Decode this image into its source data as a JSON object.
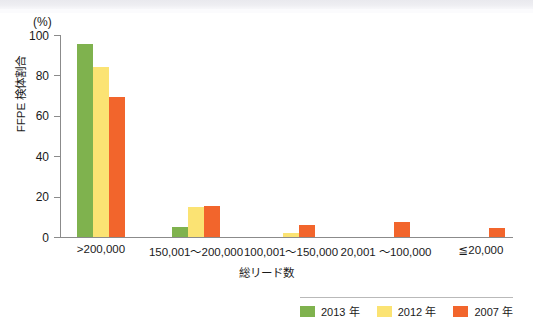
{
  "chart_data": {
    "type": "bar",
    "title": "",
    "subtitle": "",
    "unit_label": "(%)",
    "xlabel": "総リード数",
    "ylabel": "FFPE 検体割合",
    "categories": [
      ">200,000",
      "150,001〜200,000",
      "100,001〜150,000",
      "20,001 〜100,000",
      "≦20,000"
    ],
    "series": [
      {
        "name": "2013 年",
        "color": "#7fb24e",
        "values": [
          95.5,
          5.0,
          0,
          0,
          0
        ]
      },
      {
        "name": "2012 年",
        "color": "#fbe373",
        "values": [
          84.0,
          15.0,
          2.0,
          0,
          0
        ]
      },
      {
        "name": "2007 年",
        "color": "#f2652c",
        "values": [
          69.5,
          15.5,
          6.0,
          7.5,
          4.5
        ]
      }
    ],
    "ylim": [
      0,
      100
    ],
    "yticks": [
      0,
      20,
      40,
      60,
      80,
      100
    ],
    "ytick_labels": [
      "0",
      "20",
      "40",
      "60",
      "80",
      "100"
    ],
    "grid": false,
    "legend_position": "bottom-right"
  },
  "legend": {
    "items": [
      {
        "label": "2013 年",
        "color": "#7fb24e"
      },
      {
        "label": "2012 年",
        "color": "#fbe373"
      },
      {
        "label": "2007 年",
        "color": "#f2652c"
      }
    ]
  }
}
